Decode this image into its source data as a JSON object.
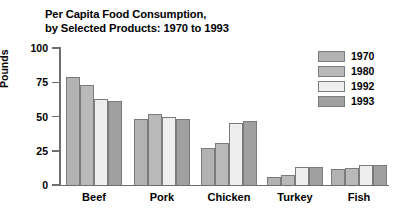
{
  "chart_data": {
    "type": "bar",
    "title": "Per Capita Food Consumption, by Selected Products: 1970 to 1993",
    "title_line1": "Per Capita Food Consumption,",
    "title_line2": "by Selected Products: 1970 to 1993",
    "xlabel": "",
    "ylabel": "Pounds",
    "ylim": [
      0,
      100
    ],
    "yticks": [
      0,
      25,
      50,
      75,
      100
    ],
    "ytick_labels": [
      "0",
      "25",
      "50",
      "75",
      "100"
    ],
    "grid": false,
    "legend_position": "top-right",
    "categories": [
      "Beef",
      "Pork",
      "Chicken",
      "Turkey",
      "Fish"
    ],
    "series": [
      {
        "name": "1970",
        "color": "#b2b2b2",
        "values": [
          79,
          48,
          27,
          6,
          11.5
        ]
      },
      {
        "name": "1980",
        "color": "#b9b9b9",
        "values": [
          73,
          52,
          30.5,
          7,
          12.5
        ]
      },
      {
        "name": "1992",
        "color": "#eeeeee",
        "values": [
          63,
          50,
          45.5,
          13,
          14.5
        ]
      },
      {
        "name": "1993",
        "color": "#a0a0a0",
        "values": [
          61,
          48.5,
          47,
          13.5,
          14.5
        ]
      }
    ]
  },
  "axis": {
    "line_color": "#6f6f6f",
    "bar_border_color": "#7b7b7b"
  }
}
